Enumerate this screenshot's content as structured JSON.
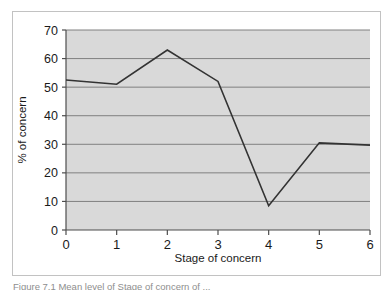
{
  "figure": {
    "caption": "Figure  7.1  Mean level of Stage of concern of ...",
    "background_color": "#ffffff",
    "frame_color": "#c2c2c2"
  },
  "chart_data": {
    "type": "line",
    "title": "",
    "subtitle": "",
    "xlabel": "Stage of concern",
    "ylabel": "% of concern",
    "categories": [
      "0",
      "1",
      "2",
      "3",
      "4",
      "5",
      "6"
    ],
    "x": [
      0,
      1,
      2,
      3,
      4,
      5,
      6
    ],
    "values": [
      52.5,
      51,
      63,
      52,
      8.5,
      30.5,
      29.7
    ],
    "series": [
      {
        "name": "% of concern",
        "values": [
          52.5,
          51,
          63,
          52,
          8.5,
          30.5,
          29.7
        ]
      }
    ],
    "xlim": [
      0,
      6
    ],
    "ylim": [
      0,
      70
    ],
    "ytick_labels": [
      "0",
      "10",
      "20",
      "30",
      "40",
      "50",
      "60",
      "70"
    ],
    "ytick_values": [
      0,
      10,
      20,
      30,
      40,
      50,
      60,
      70
    ],
    "xtick_labels": [
      "0",
      "1",
      "2",
      "3",
      "4",
      "5",
      "6"
    ],
    "grid": "horizontal",
    "legend": "none",
    "line_color": "#333333",
    "plot_background": "#d9d9d9",
    "gridline_color": "#808080",
    "axis_color": "#4d4d4d"
  }
}
